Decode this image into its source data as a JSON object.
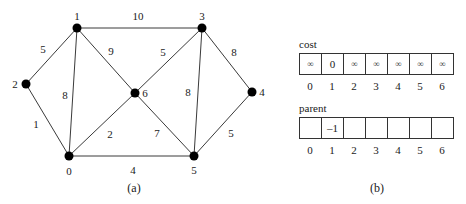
{
  "figure_a": {
    "caption": "(a)",
    "nodes": [
      {
        "id": "0",
        "label": "0",
        "x": 69,
        "y": 156,
        "lx": 69,
        "ly": 171
      },
      {
        "id": "1",
        "label": "1",
        "x": 77,
        "y": 28,
        "lx": 77,
        "ly": 16
      },
      {
        "id": "2",
        "label": "2",
        "x": 26,
        "y": 84,
        "lx": 15,
        "ly": 84
      },
      {
        "id": "3",
        "label": "3",
        "x": 202,
        "y": 28,
        "lx": 202,
        "ly": 16
      },
      {
        "id": "4",
        "label": "4",
        "x": 252,
        "y": 92,
        "lx": 262,
        "ly": 92
      },
      {
        "id": "5",
        "label": "5",
        "x": 194,
        "y": 156,
        "lx": 194,
        "ly": 170
      },
      {
        "id": "6",
        "label": "6",
        "x": 135,
        "y": 93,
        "lx": 145,
        "ly": 93
      }
    ],
    "edges": [
      {
        "from": "1",
        "to": "3",
        "weight": "10",
        "lx": 138,
        "ly": 16
      },
      {
        "from": "1",
        "to": "2",
        "weight": "5",
        "lx": 43,
        "ly": 49
      },
      {
        "from": "1",
        "to": "6",
        "weight": "9",
        "lx": 111,
        "ly": 51
      },
      {
        "from": "1",
        "to": "0",
        "weight": "8",
        "lx": 65,
        "ly": 95
      },
      {
        "from": "2",
        "to": "0",
        "weight": "1",
        "lx": 36,
        "ly": 124
      },
      {
        "from": "6",
        "to": "3",
        "weight": "5",
        "lx": 163,
        "ly": 52
      },
      {
        "from": "6",
        "to": "0",
        "weight": "2",
        "lx": 110,
        "ly": 134
      },
      {
        "from": "6",
        "to": "5",
        "weight": "7",
        "lx": 157,
        "ly": 133
      },
      {
        "from": "3",
        "to": "5",
        "weight": "8",
        "lx": 188,
        "ly": 92
      },
      {
        "from": "3",
        "to": "4",
        "weight": "8",
        "lx": 234,
        "ly": 52
      },
      {
        "from": "4",
        "to": "5",
        "weight": "5",
        "lx": 231,
        "ly": 133
      },
      {
        "from": "0",
        "to": "5",
        "weight": "4",
        "lx": 133,
        "ly": 170
      }
    ]
  },
  "figure_b": {
    "caption": "(b)",
    "cost": {
      "title": "cost",
      "values": [
        "∞",
        "0",
        "∞",
        "∞",
        "∞",
        "∞",
        "∞"
      ],
      "indices": [
        "0",
        "1",
        "2",
        "3",
        "4",
        "5",
        "6"
      ]
    },
    "parent": {
      "title": "parent",
      "values": [
        "",
        "–1",
        "",
        "",
        "",
        "",
        ""
      ],
      "indices": [
        "0",
        "1",
        "2",
        "3",
        "4",
        "5",
        "6"
      ]
    }
  }
}
